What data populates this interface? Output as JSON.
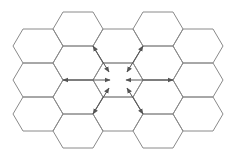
{
  "diagram": {
    "type": "hexagonal-cell-grid",
    "hex_geometry": {
      "half_width": 25,
      "half_height": 17,
      "edge_inset": 10
    },
    "colors": {
      "hex_stroke": "#8a8a8a",
      "arrow": "#555555",
      "background": "#ffffff"
    },
    "cells": [
      {
        "cx": 38,
        "cy": 46
      },
      {
        "cx": 38,
        "cy": 80
      },
      {
        "cx": 38,
        "cy": 114
      },
      {
        "cx": 78,
        "cy": 29
      },
      {
        "cx": 78,
        "cy": 63
      },
      {
        "cx": 78,
        "cy": 97
      },
      {
        "cx": 78,
        "cy": 131
      },
      {
        "cx": 118,
        "cy": 46
      },
      {
        "cx": 118,
        "cy": 80,
        "center": true
      },
      {
        "cx": 118,
        "cy": 114
      },
      {
        "cx": 158,
        "cy": 29
      },
      {
        "cx": 158,
        "cy": 63
      },
      {
        "cx": 158,
        "cy": 97
      },
      {
        "cx": 158,
        "cy": 131
      },
      {
        "cx": 198,
        "cy": 46
      },
      {
        "cx": 198,
        "cy": 80
      },
      {
        "cx": 198,
        "cy": 114
      }
    ],
    "arrows": [
      {
        "name": "west",
        "x1": 63,
        "y1": 80,
        "x2": 110,
        "y2": 80
      },
      {
        "name": "east",
        "x1": 173,
        "y1": 80,
        "x2": 126,
        "y2": 80
      },
      {
        "name": "north-west",
        "x1": 93,
        "y1": 46,
        "x2": 109,
        "y2": 72
      },
      {
        "name": "north-east",
        "x1": 143,
        "y1": 46,
        "x2": 127,
        "y2": 72
      },
      {
        "name": "south-west",
        "x1": 93,
        "y1": 114,
        "x2": 109,
        "y2": 88
      },
      {
        "name": "south-east",
        "x1": 143,
        "y1": 114,
        "x2": 127,
        "y2": 88
      }
    ]
  }
}
